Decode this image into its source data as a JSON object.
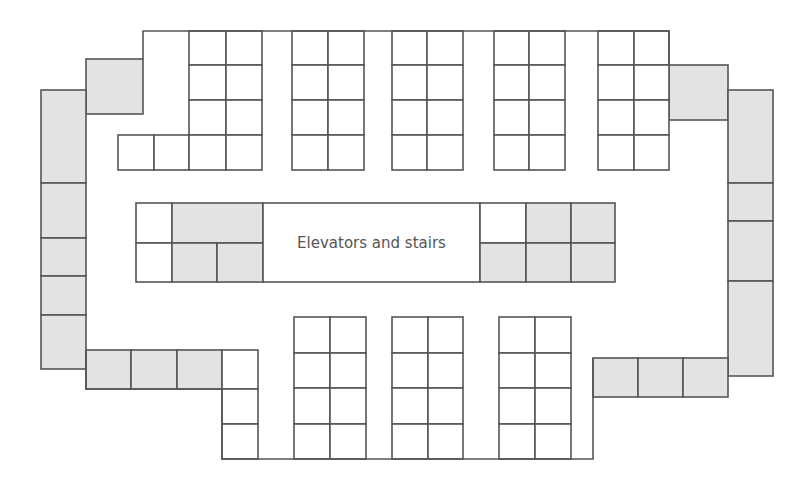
{
  "core": {
    "label": "Elevators and stairs",
    "rect": [
      263,
      203,
      217,
      79
    ]
  },
  "colors": {
    "line": "#555555",
    "gray_fill": "#e3e3e3",
    "white_fill": "#ffffff"
  },
  "outline_path": "M143 59 L143 31 L669 31 L669 65 M86 350 L86 389 L222 389 L222 459 L593 459 L593 358",
  "rooms": [
    {
      "id": "tl-office",
      "x": 86,
      "y": 59,
      "w": 57,
      "h": 55,
      "fill": "gray"
    },
    {
      "id": "left-1",
      "x": 41,
      "y": 90,
      "w": 45,
      "h": 93,
      "fill": "gray"
    },
    {
      "id": "left-2",
      "x": 41,
      "y": 183,
      "w": 45,
      "h": 55,
      "fill": "gray"
    },
    {
      "id": "left-3",
      "x": 41,
      "y": 238,
      "w": 45,
      "h": 38,
      "fill": "gray"
    },
    {
      "id": "left-4",
      "x": 41,
      "y": 276,
      "w": 45,
      "h": 39,
      "fill": "gray"
    },
    {
      "id": "left-5",
      "x": 41,
      "y": 315,
      "w": 45,
      "h": 54,
      "fill": "gray"
    },
    {
      "id": "bl-1",
      "x": 86,
      "y": 350,
      "w": 45,
      "h": 39,
      "fill": "gray"
    },
    {
      "id": "bl-2",
      "x": 131,
      "y": 350,
      "w": 46,
      "h": 39,
      "fill": "gray"
    },
    {
      "id": "bl-3",
      "x": 177,
      "y": 350,
      "w": 45,
      "h": 39,
      "fill": "gray"
    },
    {
      "id": "tr-office",
      "x": 669,
      "y": 65,
      "w": 59,
      "h": 55,
      "fill": "gray"
    },
    {
      "id": "right-1",
      "x": 728,
      "y": 90,
      "w": 45,
      "h": 93,
      "fill": "gray"
    },
    {
      "id": "right-2",
      "x": 728,
      "y": 183,
      "w": 45,
      "h": 38,
      "fill": "gray"
    },
    {
      "id": "right-3",
      "x": 728,
      "y": 221,
      "w": 45,
      "h": 60,
      "fill": "gray"
    },
    {
      "id": "right-4",
      "x": 728,
      "y": 281,
      "w": 45,
      "h": 95,
      "fill": "gray"
    },
    {
      "id": "br-1",
      "x": 593,
      "y": 358,
      "w": 45,
      "h": 39,
      "fill": "gray"
    },
    {
      "id": "br-2",
      "x": 638,
      "y": 358,
      "w": 45,
      "h": 39,
      "fill": "gray"
    },
    {
      "id": "br-3",
      "x": 683,
      "y": 358,
      "w": 45,
      "h": 39,
      "fill": "gray"
    },
    {
      "id": "core-l-1",
      "x": 136,
      "y": 203,
      "w": 36,
      "h": 40,
      "fill": "white"
    },
    {
      "id": "core-l-2",
      "x": 136,
      "y": 243,
      "w": 36,
      "h": 39,
      "fill": "white"
    },
    {
      "id": "core-l-3",
      "x": 172,
      "y": 203,
      "w": 91,
      "h": 40,
      "fill": "gray"
    },
    {
      "id": "core-l-4",
      "x": 172,
      "y": 243,
      "w": 45,
      "h": 39,
      "fill": "gray"
    },
    {
      "id": "core-l-5",
      "x": 217,
      "y": 243,
      "w": 46,
      "h": 39,
      "fill": "gray"
    },
    {
      "id": "core-center",
      "x": 263,
      "y": 203,
      "w": 217,
      "h": 79,
      "fill": "white"
    },
    {
      "id": "core-r-1",
      "x": 480,
      "y": 203,
      "w": 46,
      "h": 40,
      "fill": "white"
    },
    {
      "id": "core-r-2",
      "x": 526,
      "y": 203,
      "w": 45,
      "h": 40,
      "fill": "gray"
    },
    {
      "id": "core-r-3",
      "x": 571,
      "y": 203,
      "w": 44,
      "h": 40,
      "fill": "gray"
    },
    {
      "id": "core-r-4",
      "x": 480,
      "y": 243,
      "w": 46,
      "h": 39,
      "fill": "gray"
    },
    {
      "id": "core-r-5",
      "x": 526,
      "y": 243,
      "w": 45,
      "h": 39,
      "fill": "gray"
    },
    {
      "id": "core-r-6",
      "x": 571,
      "y": 243,
      "w": 44,
      "h": 39,
      "fill": "gray"
    },
    {
      "id": "tl-small-1",
      "x": 118,
      "y": 135,
      "w": 36,
      "h": 35,
      "fill": "white"
    },
    {
      "id": "tl-small-2",
      "x": 154,
      "y": 135,
      "w": 35,
      "h": 35,
      "fill": "white"
    },
    {
      "id": "bl-small-1",
      "x": 222,
      "y": 350,
      "w": 36,
      "h": 39,
      "fill": "white"
    },
    {
      "id": "bl-small-2",
      "x": 222,
      "y": 389,
      "w": 36,
      "h": 35,
      "fill": "white"
    },
    {
      "id": "bl-small-3",
      "x": 222,
      "y": 424,
      "w": 36,
      "h": 35,
      "fill": "white"
    }
  ],
  "workstation_clusters": [
    {
      "id": "top-1",
      "x": 189,
      "y": 31,
      "cols": [
        37,
        36
      ],
      "rows": [
        34,
        35,
        35,
        35
      ]
    },
    {
      "id": "top-2",
      "x": 292,
      "y": 31,
      "cols": [
        36,
        36
      ],
      "rows": [
        34,
        35,
        35,
        35
      ]
    },
    {
      "id": "top-3",
      "x": 392,
      "y": 31,
      "cols": [
        35,
        36
      ],
      "rows": [
        34,
        35,
        35,
        35
      ]
    },
    {
      "id": "top-4",
      "x": 494,
      "y": 31,
      "cols": [
        35,
        36
      ],
      "rows": [
        34,
        35,
        35,
        35
      ]
    },
    {
      "id": "top-5",
      "x": 598,
      "y": 31,
      "cols": [
        36,
        35
      ],
      "rows": [
        34,
        35,
        35,
        35
      ]
    },
    {
      "id": "bottom-1",
      "x": 294,
      "y": 317,
      "cols": [
        36,
        36
      ],
      "rows": [
        36,
        35,
        36,
        35
      ]
    },
    {
      "id": "bottom-2",
      "x": 392,
      "y": 317,
      "cols": [
        36,
        35
      ],
      "rows": [
        36,
        35,
        36,
        35
      ]
    },
    {
      "id": "bottom-3",
      "x": 499,
      "y": 317,
      "cols": [
        36,
        36
      ],
      "rows": [
        36,
        35,
        36,
        35
      ]
    }
  ]
}
